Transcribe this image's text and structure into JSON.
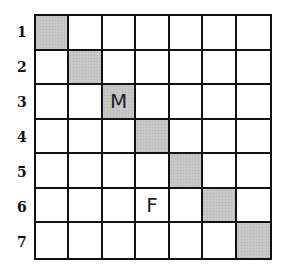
{
  "grid": {
    "rows": 7,
    "cols": 7,
    "row_labels": [
      "1",
      "2",
      "3",
      "4",
      "5",
      "6",
      "7"
    ],
    "shaded_cells": [
      {
        "row": 1,
        "col": 1
      },
      {
        "row": 2,
        "col": 2
      },
      {
        "row": 3,
        "col": 3
      },
      {
        "row": 4,
        "col": 4
      },
      {
        "row": 5,
        "col": 5
      },
      {
        "row": 6,
        "col": 6
      },
      {
        "row": 7,
        "col": 7
      }
    ],
    "cell_letters": [
      {
        "row": 3,
        "col": 3,
        "letter": "M"
      },
      {
        "row": 6,
        "col": 4,
        "letter": "F"
      }
    ],
    "colors": {
      "line": "#111111",
      "shade": "#c8c8c8",
      "background": "#ffffff"
    }
  },
  "labels": {
    "r1": "1",
    "r2": "2",
    "r3": "3",
    "r4": "4",
    "r5": "5",
    "r6": "6",
    "r7": "7"
  },
  "cells": {
    "r3c3": "M",
    "r6c4": "F"
  }
}
